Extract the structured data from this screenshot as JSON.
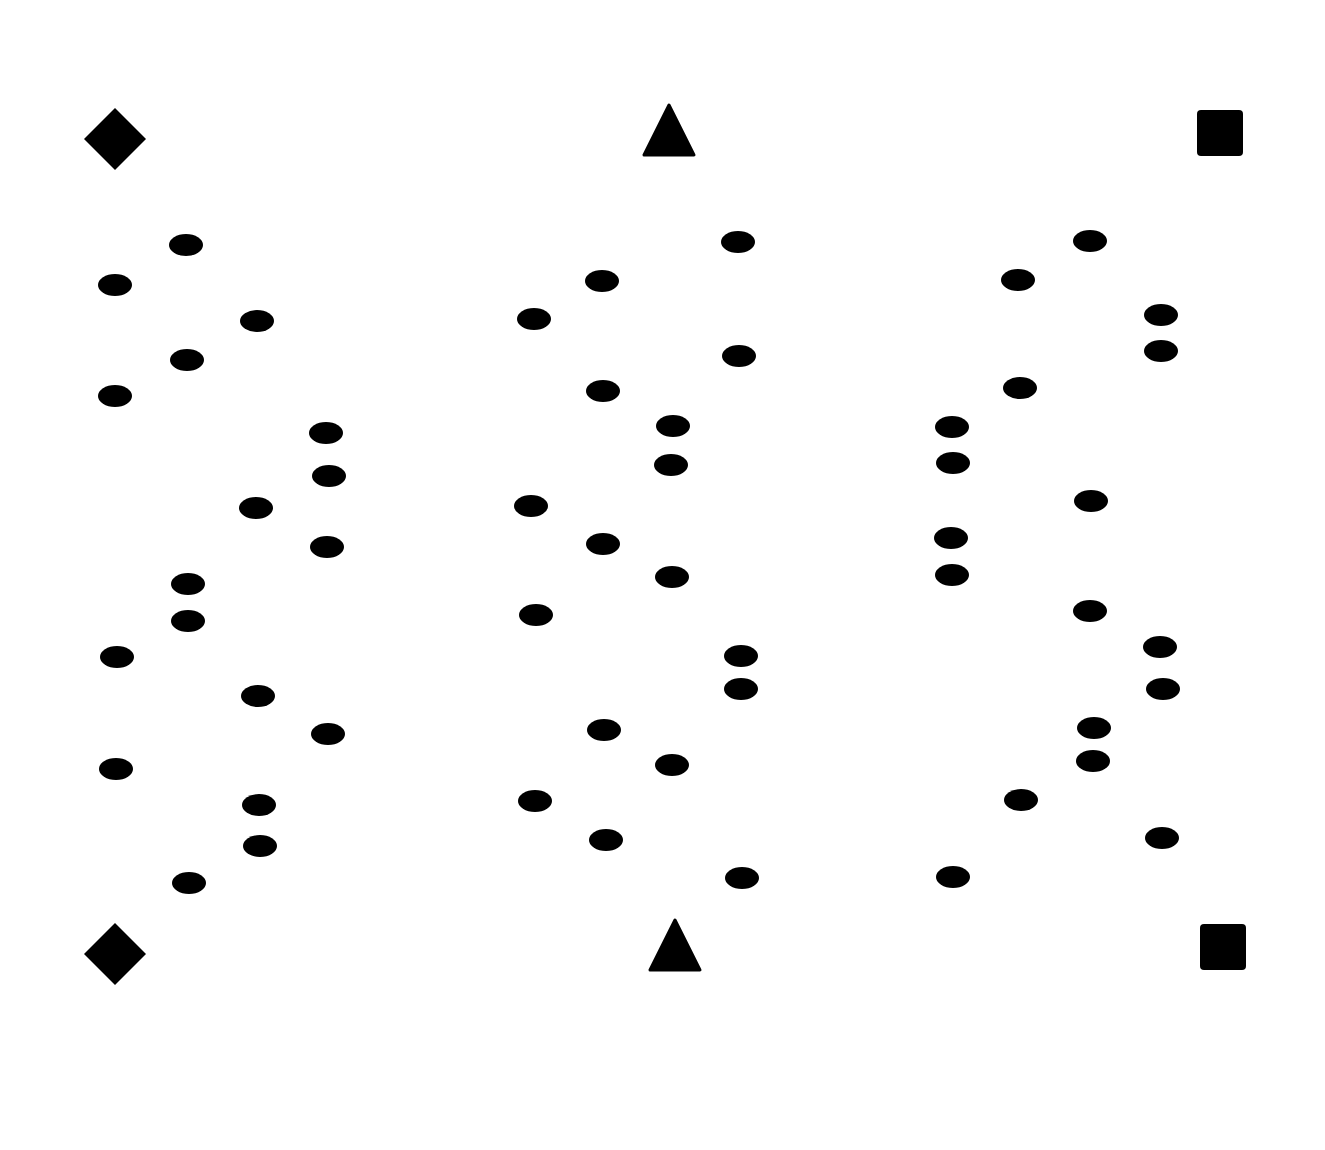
{
  "page": {
    "background": "#ffffff",
    "ink": "#000000"
  },
  "markers": [
    {
      "shape": "diamond",
      "column": "left",
      "row": "top"
    },
    {
      "shape": "triangle",
      "column": "middle",
      "row": "top"
    },
    {
      "shape": "square",
      "column": "right",
      "row": "top"
    },
    {
      "shape": "diamond",
      "column": "left",
      "row": "bottom"
    },
    {
      "shape": "triangle",
      "column": "middle",
      "row": "bottom"
    },
    {
      "shape": "square",
      "column": "right",
      "row": "bottom"
    }
  ],
  "dot_groups": [
    {
      "name": "left-panel",
      "dot_count": 26
    },
    {
      "name": "middle-panel",
      "dot_count": 24
    },
    {
      "name": "right-panel",
      "dot_count": 24
    }
  ]
}
